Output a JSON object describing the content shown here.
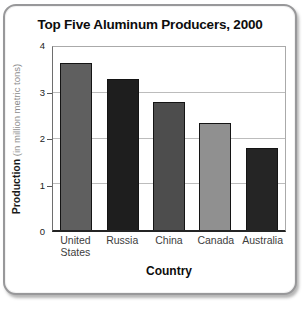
{
  "chart_data": {
    "type": "bar",
    "title": "Top Five Aluminum Producers, 2000",
    "categories": [
      "United States",
      "Russia",
      "China",
      "Canada",
      "Australia"
    ],
    "values": [
      3.65,
      3.3,
      2.8,
      2.35,
      1.8
    ],
    "bar_colors": [
      "#5f5f5f",
      "#1e1e1e",
      "#4d4d4d",
      "#909090",
      "#252525"
    ],
    "xlabel": "Country",
    "ylabel": "Production (in million metric tons)",
    "ylabel_main": "Production",
    "ylabel_unit": "(in million metric tons)",
    "ylim": [
      0,
      4
    ],
    "yticks": [
      0,
      1,
      2,
      3,
      4
    ],
    "gridlines": [
      1,
      2,
      3
    ],
    "grid": "horizontal",
    "legend": "none",
    "colors": {
      "grid": "#bcbcbc",
      "card_border": "#98989a",
      "bar_border": "#141414",
      "title_text": "#0d0d0d",
      "axis_text": "#3d3d3d"
    }
  }
}
